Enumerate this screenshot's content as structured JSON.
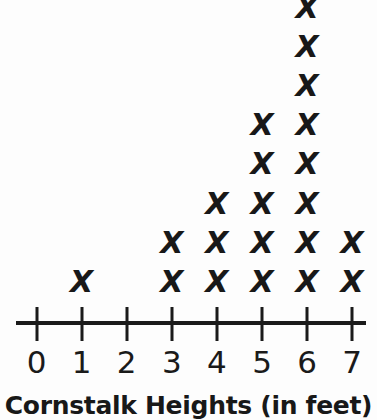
{
  "chart_data": {
    "type": "scatter",
    "plot_style": "dot-plot-x-marks",
    "title": "Cornstalk Heights (in feet)",
    "xlabel": "",
    "ylabel": "",
    "categories": [
      "0",
      "1",
      "2",
      "3",
      "4",
      "5",
      "6",
      "7"
    ],
    "x": [
      0,
      1,
      2,
      3,
      4,
      5,
      6,
      7
    ],
    "values": [
      0,
      1,
      0,
      2,
      3,
      5,
      8,
      2
    ],
    "tick_labels": [
      "0",
      "1",
      "2",
      "3",
      "4",
      "5",
      "6",
      "7"
    ],
    "xlim": [
      0,
      7
    ],
    "grid": false,
    "legend": null,
    "mark_glyph": "X",
    "mark_color": "#181818",
    "axis_color": "#1a1a1a",
    "background_color": "#fdfdfd"
  },
  "axis": {
    "tick_values": [
      "0",
      "1",
      "2",
      "3",
      "4",
      "5",
      "6",
      "7"
    ]
  },
  "title": {
    "text": "Cornstalk Heights (in feet)"
  }
}
